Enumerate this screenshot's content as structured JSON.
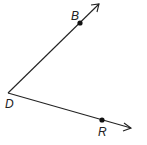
{
  "diagram": {
    "type": "angle",
    "name": "angle BDR",
    "vertex": {
      "label": "D",
      "x": 8,
      "y": 93
    },
    "rays": [
      {
        "from": "D",
        "through": "B",
        "point": {
          "label": "B",
          "x": 80,
          "y": 23
        },
        "arrow_tip": {
          "x": 99,
          "y": 4
        }
      },
      {
        "from": "D",
        "through": "R",
        "point": {
          "label": "R",
          "x": 102,
          "y": 120
        },
        "arrow_tip": {
          "x": 131,
          "y": 128
        }
      }
    ],
    "line_color": "#222222"
  }
}
